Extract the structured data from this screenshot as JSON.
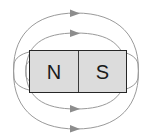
{
  "diagram": {
    "background_color": "#ffffff",
    "magnet": {
      "fill_color": "#dcdcdc",
      "border_color": "#262626",
      "north_label": "N",
      "south_label": "S",
      "divider_color": "#3a3a3a"
    },
    "field": {
      "line_color": "#9a9a9a",
      "arrow_color": "#8d8d8d",
      "line_count": 4,
      "arrow_direction": "right",
      "lines": [
        {
          "name": "outer-upper-loop",
          "position": "above-magnet",
          "order": 1
        },
        {
          "name": "inner-upper-loop",
          "position": "above-magnet",
          "order": 2
        },
        {
          "name": "inner-lower-loop",
          "position": "below-magnet",
          "order": 3
        },
        {
          "name": "outer-lower-loop",
          "position": "below-magnet",
          "order": 4
        }
      ]
    }
  }
}
